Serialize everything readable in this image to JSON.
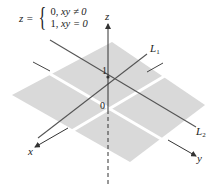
{
  "formula": {
    "lhs": "z =",
    "cases": [
      {
        "value": "0,",
        "condition": "xy ≠ 0"
      },
      {
        "value": "1,",
        "condition": "xy = 0"
      }
    ]
  },
  "axes": {
    "x_label": "x",
    "y_label": "y",
    "z_label": "z"
  },
  "ticks": {
    "origin": "0",
    "z_one": "1"
  },
  "lines": {
    "L1": {
      "name": "L",
      "sub": "1"
    },
    "L2": {
      "name": "L",
      "sub": "2"
    }
  },
  "colors": {
    "plane": "#d9d9d9",
    "axis": "#333333",
    "line": "#555555"
  }
}
